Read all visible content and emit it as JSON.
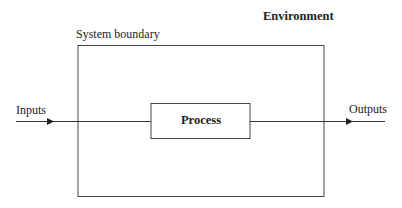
{
  "diagram": {
    "environment_label": "Environment",
    "system_boundary_label": "System boundary",
    "inputs_label": "Inputs",
    "outputs_label": "Outputs",
    "process_label": "Process",
    "stroke_color": "#333333"
  }
}
